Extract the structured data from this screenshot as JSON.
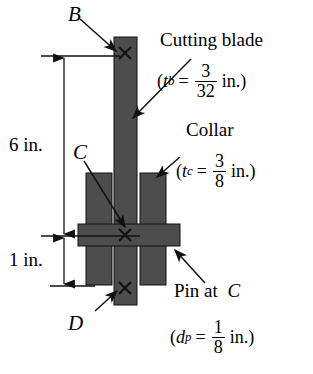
{
  "figure": {
    "colors": {
      "fill": "#4d4d4d",
      "outline": "#000000",
      "background": "#ffffff"
    },
    "point_labels": {
      "b": "B",
      "c": "C",
      "d": "D"
    },
    "dimensions": {
      "upper": "6 in.",
      "lower": "1 in."
    },
    "annotations": {
      "blade": {
        "name": "Cutting blade",
        "symbol": "t",
        "subscript": "b",
        "equals": "=",
        "numerator": "3",
        "denominator": "32",
        "unit": "in.",
        "open_paren": "(",
        "close_paren": ")"
      },
      "collar": {
        "name": "Collar",
        "symbol": "t",
        "subscript": "c",
        "equals": "=",
        "numerator": "3",
        "denominator": "8",
        "unit": "in.",
        "open_paren": "(",
        "close_paren": ")"
      },
      "pin": {
        "name": "Pin at",
        "name_point": "C",
        "symbol": "d",
        "subscript": "p",
        "equals": "=",
        "numerator": "1",
        "denominator": "8",
        "unit": "in.",
        "open_paren": "(",
        "close_paren": ")"
      }
    },
    "markers": {
      "b_cross": "×",
      "c_cross": "×",
      "d_cross": "×"
    }
  }
}
